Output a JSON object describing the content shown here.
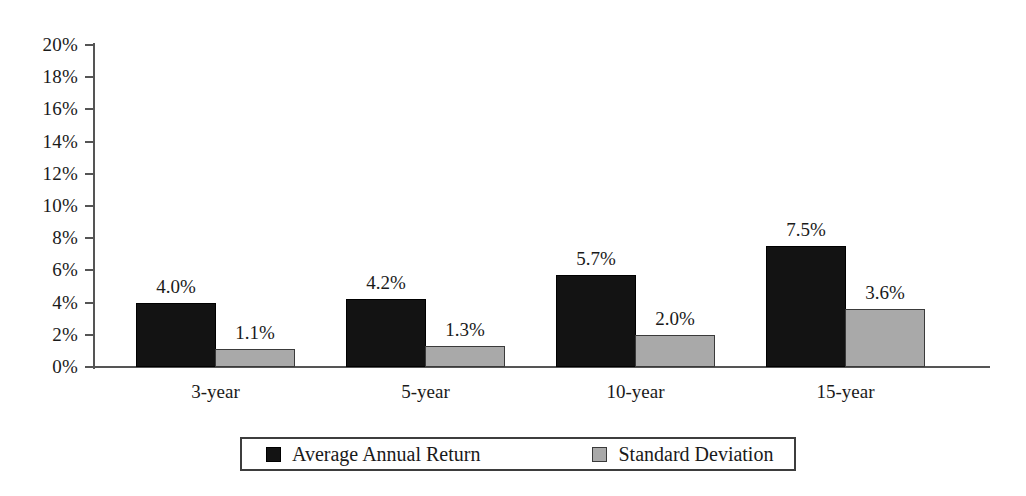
{
  "chart_data": {
    "type": "bar",
    "title": "",
    "xlabel": "",
    "ylabel": "",
    "categories": [
      "3-year",
      "5-year",
      "10-year",
      "15-year"
    ],
    "series": [
      {
        "name": "Average Annual Return",
        "color": "#131313",
        "values": [
          4.0,
          4.2,
          5.7,
          7.5
        ],
        "labels": [
          "4.0%",
          "4.2%",
          "5.7%",
          "7.5%"
        ]
      },
      {
        "name": "Standard Deviation",
        "color": "#a9a9a9",
        "values": [
          1.1,
          1.3,
          2.0,
          3.6
        ],
        "labels": [
          "1.1%",
          "1.3%",
          "2.0%",
          "3.6%"
        ]
      }
    ],
    "ylim": [
      0,
      20
    ],
    "ytick_step": 2,
    "ytick_labels": [
      "20%",
      "18%",
      "16%",
      "14%",
      "12%",
      "10%",
      "8%",
      "6%",
      "4%",
      "2%",
      "0%"
    ],
    "ytick_values": [
      20,
      18,
      16,
      14,
      12,
      10,
      8,
      6,
      4,
      2,
      0
    ],
    "grid": false,
    "legend_position": "bottom"
  },
  "legend": {
    "entries": [
      {
        "label": "Average Annual Return"
      },
      {
        "label": "Standard Deviation"
      }
    ]
  }
}
